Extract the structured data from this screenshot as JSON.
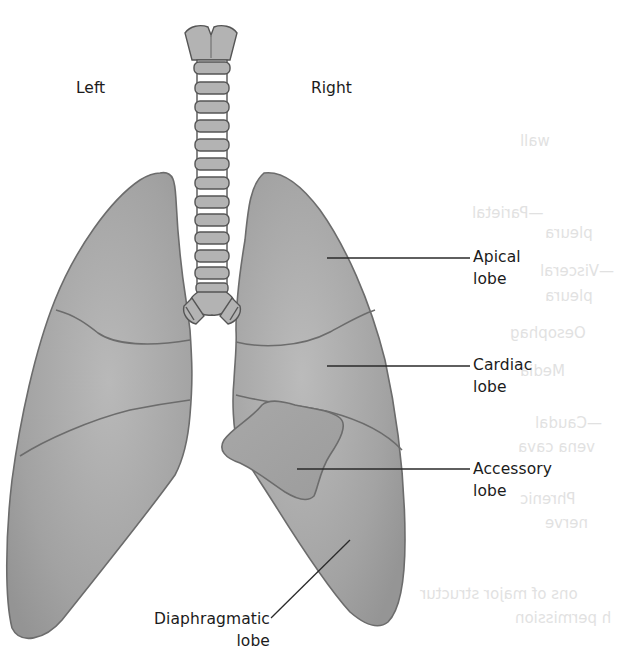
{
  "figure": {
    "orientation": {
      "left": "Left",
      "right": "Right"
    },
    "labels": [
      {
        "id": "apical",
        "line1": "Apical",
        "line2": "lobe",
        "side": "right"
      },
      {
        "id": "cardiac",
        "line1": "Cardiac",
        "line2": "lobe",
        "side": "right"
      },
      {
        "id": "accessory",
        "line1": "Accessory",
        "line2": "lobe",
        "side": "right"
      },
      {
        "id": "diaphragmatic",
        "line1": "Diaphragmatic",
        "line2": "lobe",
        "side": "bottom-left"
      }
    ],
    "bleed_through_text": [
      "—Parietal",
      "pleura",
      "—Visceral",
      "pleura",
      "Oesophag",
      "Media",
      "—Caudal",
      "vena cava",
      "Phrenic",
      "nerve",
      "ons of major structur",
      "h permission",
      "wall"
    ],
    "colors": {
      "lung_fill": "#a4a4a4",
      "lung_fill_light": "#b8b8b8",
      "outline": "#6a6a6a",
      "cartilage": "#b0b0b0",
      "leader_line": "#2a2a2a",
      "text": "#1b1b1b",
      "background": "#ffffff"
    }
  }
}
